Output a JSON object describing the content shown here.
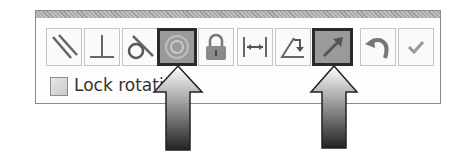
{
  "toolbar": {
    "buttons": [
      {
        "name": "parallel-button",
        "icon": "parallel-icon",
        "active": false
      },
      {
        "name": "perpendicular-button",
        "icon": "perpendicular-icon",
        "active": false
      },
      {
        "name": "tangent-button",
        "icon": "tangent-icon",
        "active": false
      },
      {
        "name": "concentric-button",
        "icon": "concentric-icon",
        "active": true
      },
      {
        "name": "lock-button",
        "icon": "lock-icon",
        "active": false
      },
      {
        "name": "distance-button",
        "icon": "distance-icon",
        "active": false
      },
      {
        "name": "angle-button",
        "icon": "angle-icon",
        "active": false
      },
      {
        "name": "flip-direction-button",
        "icon": "arrow-icon",
        "active": true
      },
      {
        "name": "undo-button",
        "icon": "undo-icon",
        "active": false
      },
      {
        "name": "ok-button",
        "icon": "checkmark-icon",
        "active": false
      }
    ]
  },
  "options": {
    "lock_rotation_label": "Lock rotati",
    "lock_rotation_checked": false
  },
  "colors": {
    "active_border": "#2a2a2a",
    "active_fill": "#9a9a9a"
  }
}
